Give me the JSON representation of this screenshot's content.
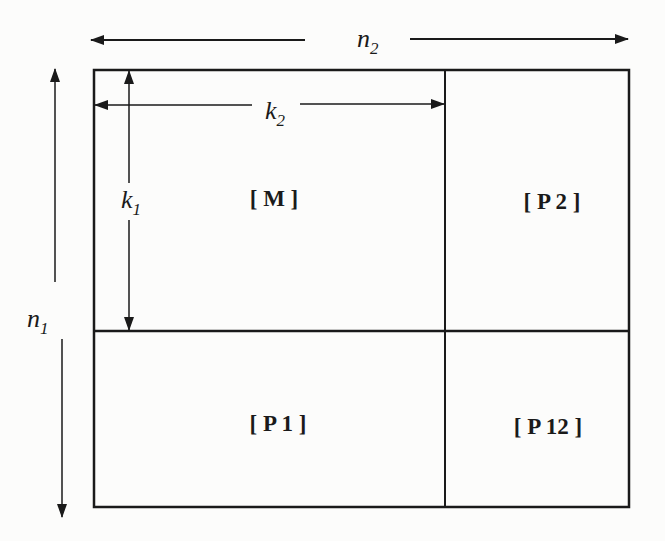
{
  "diagram": {
    "title": "",
    "blocks": {
      "top_left": "[ M ]",
      "top_right": "[ P 2 ]",
      "bottom_left": "[ P 1 ]",
      "bottom_right": "[ P 12 ]"
    },
    "dimensions": {
      "n2": {
        "base": "n",
        "sub": "2"
      },
      "k2": {
        "base": "k",
        "sub": "2"
      },
      "n1": {
        "base": "n",
        "sub": "1"
      },
      "k1": {
        "base": "k",
        "sub": "1"
      }
    },
    "colors": {
      "line": "#1a1a1a",
      "background": "#fcfcfb"
    }
  }
}
